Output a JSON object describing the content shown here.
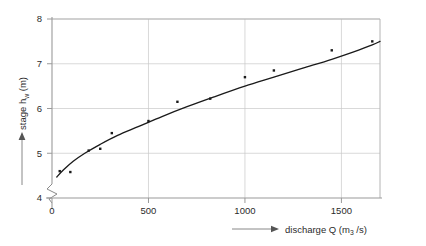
{
  "chart_data": {
    "type": "scatter",
    "title": "",
    "subtitle": "",
    "xlabel": "discharge Q (m3 /s)",
    "xlabel_main": "discharge Q (m",
    "xlabel_sub": "3",
    "xlabel_tail": " /s)",
    "ylabel": "stage hw (m)",
    "ylabel_main": "stage h",
    "ylabel_sub": "w",
    "ylabel_tail": " (m)",
    "xlim": [
      0,
      1700
    ],
    "ylim": [
      4,
      8
    ],
    "xticks": [
      0,
      500,
      1000,
      1500
    ],
    "xtick_labels": [
      "0",
      "500",
      "1000",
      "1500"
    ],
    "yticks": [
      4,
      5,
      6,
      7,
      8
    ],
    "ytick_labels": [
      "4",
      "5",
      "6",
      "7",
      "8"
    ],
    "grid": true,
    "legend": "none",
    "y_axis_break": true,
    "y_axis_break_symbol": "zigzag",
    "marker": "filled-square",
    "marker_color": "#1a1a1a",
    "curve_color": "#1a1a1a",
    "curve_label": "fitted rating curve",
    "points": [
      {
        "x": 40,
        "y": 4.6
      },
      {
        "x": 95,
        "y": 4.58
      },
      {
        "x": 190,
        "y": 5.06
      },
      {
        "x": 250,
        "y": 5.1
      },
      {
        "x": 310,
        "y": 5.45
      },
      {
        "x": 500,
        "y": 5.72
      },
      {
        "x": 650,
        "y": 6.15
      },
      {
        "x": 820,
        "y": 6.22
      },
      {
        "x": 1000,
        "y": 6.7
      },
      {
        "x": 1150,
        "y": 6.85
      },
      {
        "x": 1450,
        "y": 7.3
      },
      {
        "x": 1660,
        "y": 7.5
      }
    ],
    "curve": [
      {
        "x": 25,
        "y": 4.47
      },
      {
        "x": 60,
        "y": 4.63
      },
      {
        "x": 110,
        "y": 4.82
      },
      {
        "x": 170,
        "y": 5.0
      },
      {
        "x": 250,
        "y": 5.2
      },
      {
        "x": 340,
        "y": 5.4
      },
      {
        "x": 450,
        "y": 5.6
      },
      {
        "x": 570,
        "y": 5.82
      },
      {
        "x": 700,
        "y": 6.04
      },
      {
        "x": 840,
        "y": 6.26
      },
      {
        "x": 1000,
        "y": 6.5
      },
      {
        "x": 1150,
        "y": 6.7
      },
      {
        "x": 1300,
        "y": 6.9
      },
      {
        "x": 1450,
        "y": 7.1
      },
      {
        "x": 1560,
        "y": 7.26
      },
      {
        "x": 1660,
        "y": 7.42
      },
      {
        "x": 1700,
        "y": 7.5
      }
    ]
  }
}
